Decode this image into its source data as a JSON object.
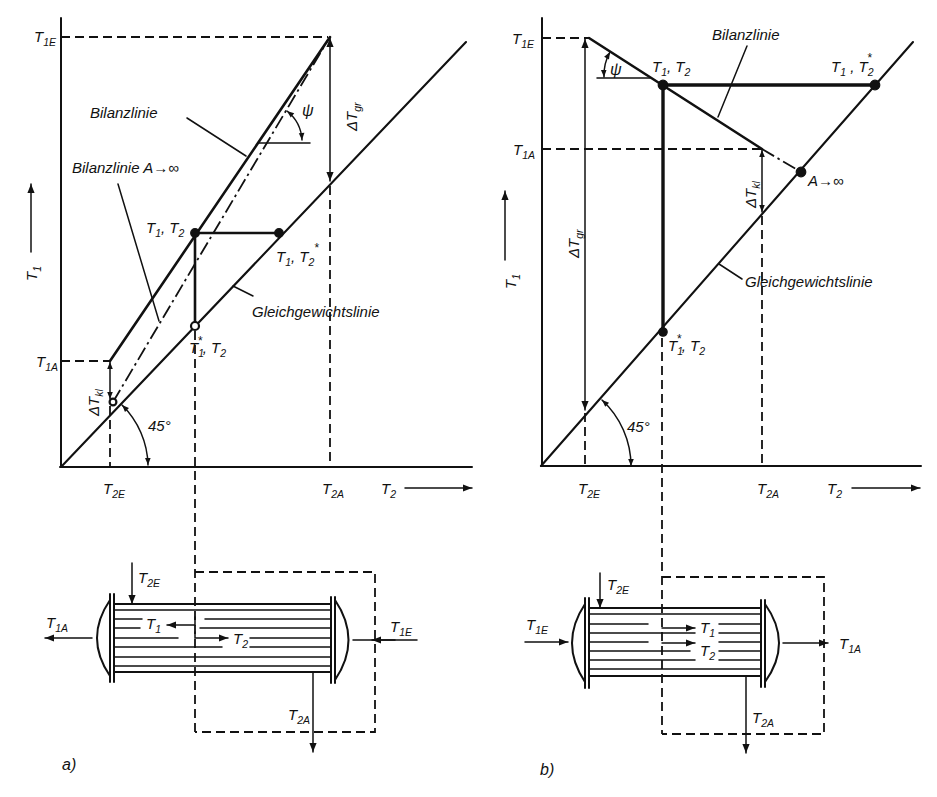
{
  "panel_a": {
    "caption": "a)",
    "y_axis": {
      "symbol": "T",
      "sub": "1"
    },
    "x_axis": {
      "symbol": "T",
      "sub": "2"
    },
    "ticks": {
      "t1e": {
        "symbol": "T",
        "sub": "1E"
      },
      "t1a": {
        "symbol": "T",
        "sub": "1A"
      },
      "t2e": {
        "symbol": "T",
        "sub": "2E"
      },
      "t2a": {
        "symbol": "T",
        "sub": "2A"
      }
    },
    "line_labels": {
      "balance": "Bilanzlinie",
      "balance_infinite": "Bilanzlinie A→∞",
      "equilibrium": "Gleichgewichtslinie"
    },
    "points": {
      "operating": {
        "s1": "T",
        "sub1": "1",
        "sep": ", ",
        "s2": "T",
        "sub2": "2"
      },
      "equilibrium_t2": {
        "s1": "T",
        "sub1": "1",
        "sep": ", ",
        "s2": "T",
        "sub2": "2",
        "star2": "*"
      },
      "equilibrium_t1": {
        "s1": "T",
        "sub1": "1",
        "star1": "*",
        "sep": ", ",
        "s2": "T",
        "sub2": "2"
      }
    },
    "deltas": {
      "gr": {
        "symbol": "ΔT",
        "sub": "gr"
      },
      "kl": {
        "symbol": "ΔT",
        "sub": "kl"
      }
    },
    "angles": {
      "psi": "ψ",
      "diagonal": "45°"
    },
    "exchanger": {
      "inlet_1": {
        "symbol": "T",
        "sub": "1E"
      },
      "outlet_1": {
        "symbol": "T",
        "sub": "1A"
      },
      "inlet_2": {
        "symbol": "T",
        "sub": "2E"
      },
      "outlet_2": {
        "symbol": "T",
        "sub": "2A"
      },
      "flow_1": {
        "symbol": "T",
        "sub": "1"
      },
      "flow_2": {
        "symbol": "T",
        "sub": "2"
      }
    }
  },
  "panel_b": {
    "caption": "b)",
    "y_axis": {
      "symbol": "T",
      "sub": "1"
    },
    "x_axis": {
      "symbol": "T",
      "sub": "2"
    },
    "ticks": {
      "t1e": {
        "symbol": "T",
        "sub": "1E"
      },
      "t1a": {
        "symbol": "T",
        "sub": "1A"
      },
      "t2e": {
        "symbol": "T",
        "sub": "2E"
      },
      "t2a": {
        "symbol": "T",
        "sub": "2A"
      }
    },
    "line_labels": {
      "balance": "Bilanzlinie",
      "balance_infinite": "A→∞",
      "equilibrium": "Gleichgewichtslinie"
    },
    "points": {
      "operating": {
        "s1": "T",
        "sub1": "1",
        "sep": ", ",
        "s2": "T",
        "sub2": "2"
      },
      "equilibrium_t2": {
        "s1": "T",
        "sub1": "1",
        "sep": " , ",
        "s2": "T",
        "sub2": "2",
        "star2": "*"
      },
      "equilibrium_t1": {
        "s1": "T",
        "sub1": "1",
        "star1": "*",
        "sep": ", ",
        "s2": "T",
        "sub2": "2"
      }
    },
    "deltas": {
      "gr": {
        "symbol": "ΔT",
        "sub": "gr"
      },
      "kl": {
        "symbol": "ΔT",
        "sub": "kl"
      }
    },
    "angles": {
      "psi": "ψ",
      "diagonal": "45°"
    },
    "exchanger": {
      "inlet_1": {
        "symbol": "T",
        "sub": "1E"
      },
      "outlet_1": {
        "symbol": "T",
        "sub": "1A"
      },
      "inlet_2": {
        "symbol": "T",
        "sub": "2E"
      },
      "outlet_2": {
        "symbol": "T",
        "sub": "2A"
      },
      "flow_1": {
        "symbol": "T",
        "sub": "1"
      },
      "flow_2": {
        "symbol": "T",
        "sub": "2"
      }
    }
  },
  "colors": {
    "ink": "#111111",
    "background": "#ffffff"
  }
}
